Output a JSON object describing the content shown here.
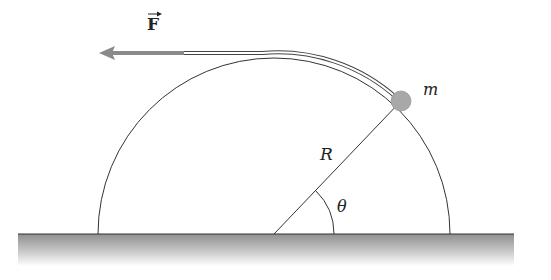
{
  "diagram": {
    "force_label": "F",
    "mass_label": "m",
    "radius_label": "R",
    "angle_label": "θ",
    "colors": {
      "line": "#333333",
      "arrow": "#8a8a8a",
      "ball": "#aaaaaa",
      "ground": "#9a9a9a"
    }
  }
}
